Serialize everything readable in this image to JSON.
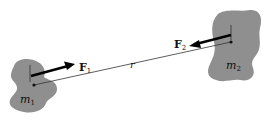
{
  "diagram": {
    "colors": {
      "mass_fill": "#8f8f8f",
      "line": "#333333",
      "arrow": "#000000",
      "background": "#ffffff"
    },
    "mass1": {
      "label": "m",
      "subscript": "1",
      "center": [
        34,
        85
      ]
    },
    "mass2": {
      "label": "m",
      "subscript": "2",
      "center": [
        231,
        42
      ]
    },
    "force1": {
      "label": "F",
      "subscript": "1",
      "direction": "toward m2"
    },
    "force2": {
      "label": "F",
      "subscript": "2",
      "direction": "toward m1"
    },
    "separation": {
      "label": "r"
    }
  }
}
